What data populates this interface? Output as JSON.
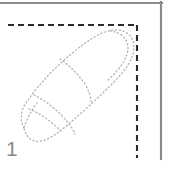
{
  "figure": {
    "step_label": "1",
    "caption": "",
    "colors": {
      "page_border": "#8c8c8c",
      "guide_dash": "#2b2b2b",
      "finger_outline": "#b0b0b0",
      "background": "#ffffff",
      "step_number": "#8a8a8a"
    },
    "page_border": {
      "name": "page-frame",
      "top_line": {
        "x1": 0,
        "y1": 3,
        "x2": 162,
        "y2": 3,
        "width": 2
      },
      "right_line": {
        "x1": 161,
        "y1": 3,
        "x2": 161,
        "y2": 159,
        "width": 2
      }
    },
    "guide_box": {
      "name": "dashed-guide-box",
      "horizontal": {
        "x1": 8,
        "y1": 25,
        "x2": 138,
        "y2": 25
      },
      "vertical": {
        "x1": 137,
        "y1": 25,
        "x2": 137,
        "y2": 158
      },
      "dash_pattern": "6 4",
      "stroke_width": 2
    },
    "finger": {
      "name": "finger-illustration",
      "description": "dotted outline of a fingertip pointing toward the upper-right corner",
      "dot_pattern": "1.2 2.6",
      "stroke_width": 1.2,
      "outline_path": "M 24 128 C 20 120 20 112 26 103 C 40 82 62 60 84 44 C 96 35 108 29 118 30 C 128 31 134 38 134 47 C 134 58 126 70 112 84 C 94 102 72 122 56 134 C 46 141 38 143 32 140 C 28 138 25 134 24 128 Z",
      "nail_path": "M 112 32 C 122 33 128 39 128 48 C 128 57 121 67 110 78",
      "crease_upper_path": "M 62 60 C 70 66 78 74 84 84 C 88 90 90 96 90 101",
      "crease_lower_path": "M 35 96 C 44 100 54 107 62 116 C 68 122 72 128 74 133",
      "knuckle_left_path": "M 24 128 C 27 120 31 112 37 104",
      "knuckle_inner_path": "M 30 110 C 40 114 52 122 62 132"
    }
  }
}
